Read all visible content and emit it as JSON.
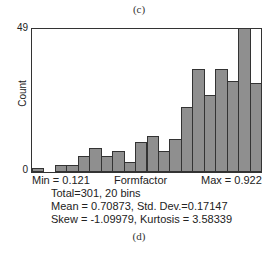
{
  "captions": {
    "top": "(c)",
    "bottom": "(d)"
  },
  "chart_data": {
    "type": "bar",
    "title": "",
    "xlabel": "Formfactor",
    "ylabel": "Count",
    "ylim": [
      0,
      49
    ],
    "y_ticks": [
      "0",
      "49"
    ],
    "x_min_label": "Min = 0.121",
    "x_max_label": "Max = 0.922",
    "x_range": [
      0.121,
      0.922
    ],
    "bins": 20,
    "categories": [
      "1",
      "2",
      "3",
      "4",
      "5",
      "6",
      "7",
      "8",
      "9",
      "10",
      "11",
      "12",
      "13",
      "14",
      "15",
      "16",
      "17",
      "18",
      "19",
      "20"
    ],
    "values": [
      1,
      0,
      2,
      2,
      5,
      8,
      5,
      7,
      3,
      10,
      12,
      7,
      11,
      22,
      35,
      26,
      35,
      31,
      49,
      30
    ],
    "grid": false,
    "bar_color": "#8f8f8f"
  },
  "stats": {
    "total_line": "Total=301, 20 bins",
    "mean_line": "Mean = 0.70873, Std. Dev.=0.17147",
    "skew_line": "Skew = -1.09979, Kurtosis = 3.58339"
  }
}
